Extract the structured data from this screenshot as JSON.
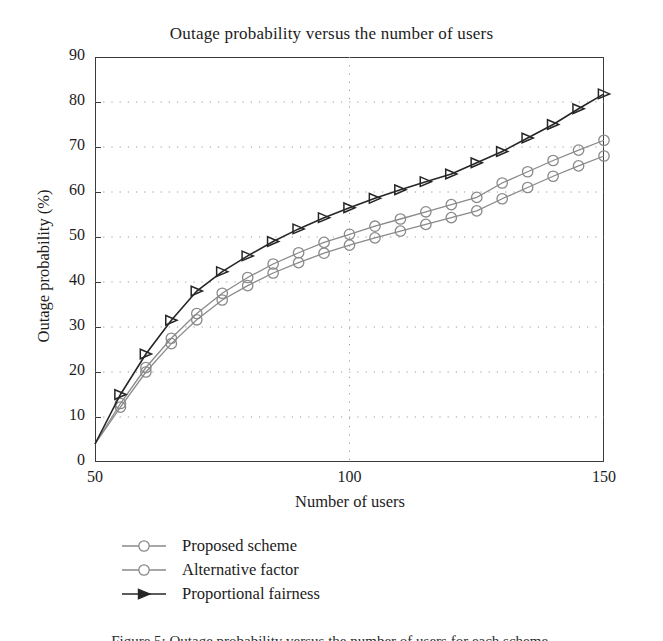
{
  "figure": {
    "title": "Outage probability versus the number of users",
    "xlabel": "Number of users",
    "ylabel": "Outage probability (%)",
    "caption": "Figure 5: Outage probability versus the number of users for each scheme."
  },
  "axes": {
    "x_ticks": [
      "50",
      "100",
      "150"
    ],
    "y_ticks": [
      "90",
      "80",
      "70",
      "60",
      "50",
      "40",
      "30",
      "20",
      "10",
      "0"
    ]
  },
  "legend": {
    "items": [
      {
        "label": "Proposed scheme",
        "marker": "circle-marker",
        "color": "#8a8a8a"
      },
      {
        "label": "Alternative factor",
        "marker": "circle-marker",
        "color": "#8a8a8a"
      },
      {
        "label": "Proportional fairness",
        "marker": "triangle-right-marker",
        "color": "#262626"
      }
    ]
  },
  "chart_data": {
    "type": "line",
    "title": "Outage probability versus the number of users",
    "xlabel": "Number of users",
    "ylabel": "Outage probability (%)",
    "xlim": [
      50,
      150
    ],
    "ylim": [
      0,
      90
    ],
    "x_ticks": [
      50,
      100,
      150
    ],
    "y_ticks": [
      0,
      10,
      20,
      30,
      40,
      50,
      60,
      70,
      80,
      90
    ],
    "grid": "dotted-horizontal-and-vertical-at-100",
    "legend_position": "below-axes-left",
    "x": [
      50,
      55,
      60,
      65,
      70,
      75,
      80,
      85,
      90,
      95,
      100,
      105,
      110,
      115,
      120,
      125,
      130,
      135,
      140,
      145,
      150
    ],
    "series": [
      {
        "name": "Proposed scheme",
        "marker": "circle",
        "color": "#8a8a8a",
        "values": [
          4.0,
          13.0,
          21.0,
          27.5,
          33.0,
          37.5,
          41.0,
          44.0,
          46.5,
          48.8,
          50.6,
          52.4,
          54.0,
          55.6,
          57.2,
          58.8,
          62.0,
          64.5,
          67.0,
          69.3,
          71.5
        ]
      },
      {
        "name": "Alternative factor",
        "marker": "circle",
        "color": "#8a8a8a",
        "values": [
          4.0,
          12.2,
          20.0,
          26.3,
          31.6,
          36.0,
          39.2,
          42.0,
          44.3,
          46.4,
          48.2,
          49.8,
          51.3,
          52.8,
          54.3,
          55.8,
          58.5,
          61.0,
          63.5,
          65.8,
          68.0
        ]
      },
      {
        "name": "Proportional fairness",
        "marker": "triangle-right",
        "color": "#262626",
        "values": [
          4.0,
          15.0,
          24.0,
          31.5,
          38.0,
          42.3,
          45.8,
          49.0,
          51.8,
          54.3,
          56.5,
          58.6,
          60.5,
          62.3,
          64.0,
          66.5,
          69.0,
          72.0,
          75.0,
          78.5,
          81.8
        ]
      }
    ]
  }
}
